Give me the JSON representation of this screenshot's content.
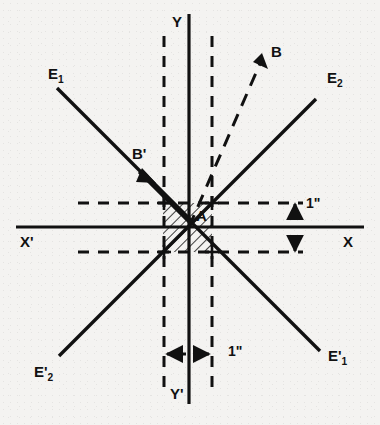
{
  "figure": {
    "type": "geometric-diagram",
    "background_color": "#f4f3f1",
    "ink_color": "#111111"
  },
  "axes": {
    "x_positive_label": "X",
    "x_negative_label": "X'",
    "y_positive_label": "Y",
    "y_negative_label": "Y'",
    "origin": {
      "x": 187,
      "y": 227
    }
  },
  "lines": [
    {
      "name": "E1",
      "label": "E",
      "subscript": "1",
      "prime": "",
      "end": "upper-left"
    },
    {
      "name": "E2",
      "label": "E",
      "subscript": "2",
      "prime": "",
      "end": "upper-right"
    },
    {
      "name": "E1p",
      "label": "E",
      "subscript": "1",
      "prime": "'",
      "end": "lower-right"
    },
    {
      "name": "E2p",
      "label": "E",
      "subscript": "2",
      "prime": "'",
      "end": "lower-left"
    }
  ],
  "points": {
    "a_label": "A",
    "b_label": "B",
    "b_prime_label": "B'"
  },
  "dimensions": {
    "vertical_label": "1\"",
    "horizontal_label": "1\"",
    "value": "1",
    "unit": "inch"
  },
  "hatching": {
    "region": "unit-square-at-origin",
    "style": "diagonal-lines"
  }
}
